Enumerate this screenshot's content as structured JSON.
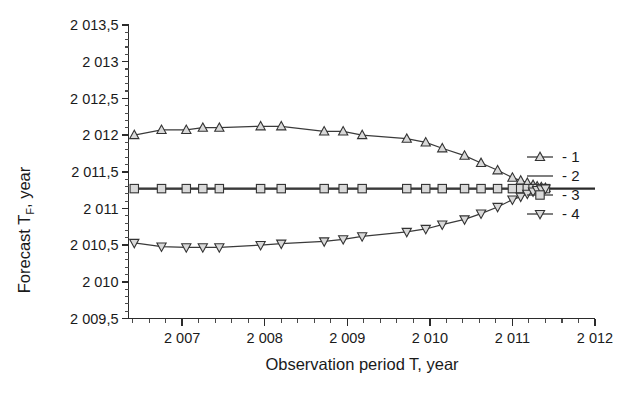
{
  "chart_data": {
    "type": "line",
    "title": "",
    "xlabel": "Observation period T, year",
    "ylabel_prefix": "Forecast T",
    "ylabel_sub": "F",
    "ylabel_suffix": ", year",
    "xlim": [
      2006.35,
      2012.0
    ],
    "ylim": [
      2009.5,
      2013.5
    ],
    "xticks": [
      2007,
      2008,
      2009,
      2010,
      2011,
      2012
    ],
    "xticklabels": [
      "2 007",
      "2 008",
      "2 009",
      "2 010",
      "2 011",
      "2 012"
    ],
    "yticks": [
      2009.5,
      2010,
      2010.5,
      2011,
      2011.5,
      2012,
      2012.5,
      2013,
      2013.5
    ],
    "yticklabels": [
      "2 009,5",
      "2 010",
      "2 010,5",
      "2 011",
      "2 011,5",
      "2 012",
      "2 012,5",
      "2 013",
      "2 013,5"
    ],
    "minor_ticks_per_interval": 4,
    "grid": false,
    "legend_position": "right",
    "series": [
      {
        "name": "1",
        "legend_label": "- 1",
        "marker": "triangle-up",
        "x": [
          2006.42,
          2006.75,
          2007.05,
          2007.25,
          2007.45,
          2007.95,
          2008.2,
          2008.72,
          2008.95,
          2009.18,
          2009.72,
          2009.95,
          2010.15,
          2010.42,
          2010.62,
          2010.82,
          2011.0,
          2011.1,
          2011.18,
          2011.25,
          2011.3,
          2011.35,
          2011.4
        ],
        "y": [
          2012.0,
          2012.07,
          2012.07,
          2012.1,
          2012.1,
          2012.12,
          2012.12,
          2012.05,
          2012.05,
          2012.0,
          2011.95,
          2011.9,
          2011.82,
          2011.72,
          2011.62,
          2011.52,
          2011.42,
          2011.38,
          2011.35,
          2011.32,
          2011.3,
          2011.29,
          2011.28
        ]
      },
      {
        "name": "2",
        "legend_label": "- 2",
        "marker": "none",
        "x": [
          2006.42,
          2012.0
        ],
        "y": [
          2011.27,
          2011.27
        ]
      },
      {
        "name": "3",
        "legend_label": "- 3",
        "marker": "square",
        "x": [
          2006.42,
          2006.75,
          2007.05,
          2007.25,
          2007.45,
          2007.95,
          2008.2,
          2008.72,
          2008.95,
          2009.18,
          2009.72,
          2009.95,
          2010.15,
          2010.42,
          2010.62,
          2010.82,
          2011.0,
          2011.1,
          2011.18,
          2011.25,
          2011.3,
          2011.35,
          2011.4
        ],
        "y": [
          2011.27,
          2011.27,
          2011.27,
          2011.27,
          2011.27,
          2011.27,
          2011.27,
          2011.27,
          2011.27,
          2011.27,
          2011.27,
          2011.27,
          2011.27,
          2011.27,
          2011.27,
          2011.27,
          2011.27,
          2011.27,
          2011.27,
          2011.27,
          2011.27,
          2011.27,
          2011.27
        ]
      },
      {
        "name": "4",
        "legend_label": "- 4",
        "marker": "triangle-down",
        "x": [
          2006.42,
          2006.75,
          2007.05,
          2007.25,
          2007.45,
          2007.95,
          2008.2,
          2008.72,
          2008.95,
          2009.18,
          2009.72,
          2009.95,
          2010.15,
          2010.42,
          2010.62,
          2010.82,
          2011.0,
          2011.1,
          2011.18,
          2011.25,
          2011.3,
          2011.35,
          2011.4
        ],
        "y": [
          2010.53,
          2010.48,
          2010.47,
          2010.47,
          2010.47,
          2010.5,
          2010.52,
          2010.55,
          2010.58,
          2010.62,
          2010.68,
          2010.72,
          2010.78,
          2010.85,
          2010.93,
          2011.02,
          2011.12,
          2011.16,
          2011.2,
          2011.23,
          2011.25,
          2011.26,
          2011.27
        ]
      }
    ]
  },
  "legend": {
    "items": [
      {
        "label": "- 1",
        "marker": "triangle-up"
      },
      {
        "label": "- 2",
        "marker": "line"
      },
      {
        "label": "- 3",
        "marker": "square"
      },
      {
        "label": "- 4",
        "marker": "triangle-down"
      }
    ]
  }
}
